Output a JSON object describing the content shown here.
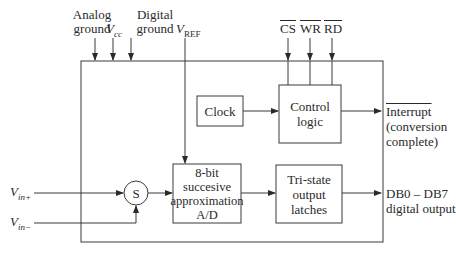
{
  "diagram": {
    "top_inputs": {
      "analog_ground": [
        "Analog",
        "ground"
      ],
      "vcc": {
        "base": "V",
        "sub": "cc"
      },
      "digital_ground": [
        "Digital",
        "ground"
      ],
      "vref": {
        "base": "V",
        "sub": "REF"
      }
    },
    "control_inputs": [
      "CS",
      "WR",
      "RD"
    ],
    "blocks": {
      "clock": "Clock",
      "control_logic": [
        "Control",
        "logic"
      ],
      "adc": [
        "8-bit",
        "succesive",
        "approximation",
        "A/D"
      ],
      "latches": [
        "Tri-state",
        "output",
        "latches"
      ],
      "summer": "S"
    },
    "inputs_left": {
      "vin_plus": {
        "base": "V",
        "sub": "in+"
      },
      "vin_minus": {
        "base": "V",
        "sub": "in−"
      }
    },
    "outputs": {
      "interrupt": "Interrupt",
      "interrupt_note": [
        "(conversion",
        "complete)"
      ],
      "data": [
        "DB0 – DB7",
        "digital output"
      ]
    },
    "colors": {
      "line": "#3a3a3a",
      "text": "#2a2a2a",
      "background": "#ffffff"
    }
  }
}
